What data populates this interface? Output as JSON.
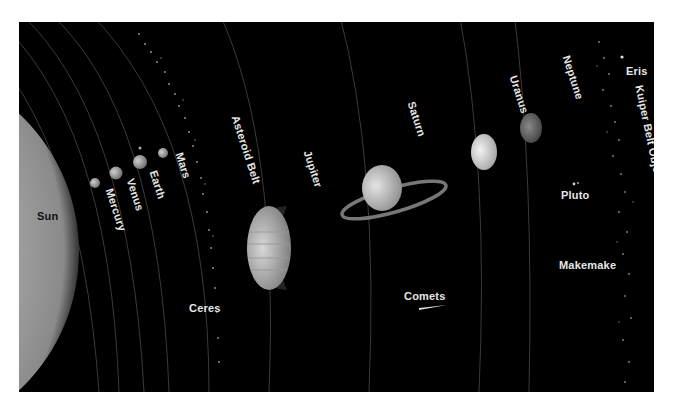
{
  "diagram": {
    "type": "solar-system-overview",
    "colors": {
      "background": "#000000",
      "page": "#ffffff",
      "label": "#e6e6e6",
      "sun_label": "#111111"
    },
    "labels": {
      "sun": "Sun",
      "mercury": "Mercury",
      "venus": "Venus",
      "earth": "Earth",
      "mars": "Mars",
      "asteroid_belt": "Asteroid Belt",
      "ceres": "Ceres",
      "jupiter": "Jupiter",
      "saturn": "Saturn",
      "comets": "Comets",
      "uranus": "Uranus",
      "neptune": "Neptune",
      "pluto": "Pluto",
      "makemake": "Makemake",
      "eris": "Eris",
      "kuiper_belt": "Kuiper Belt Objects"
    }
  }
}
